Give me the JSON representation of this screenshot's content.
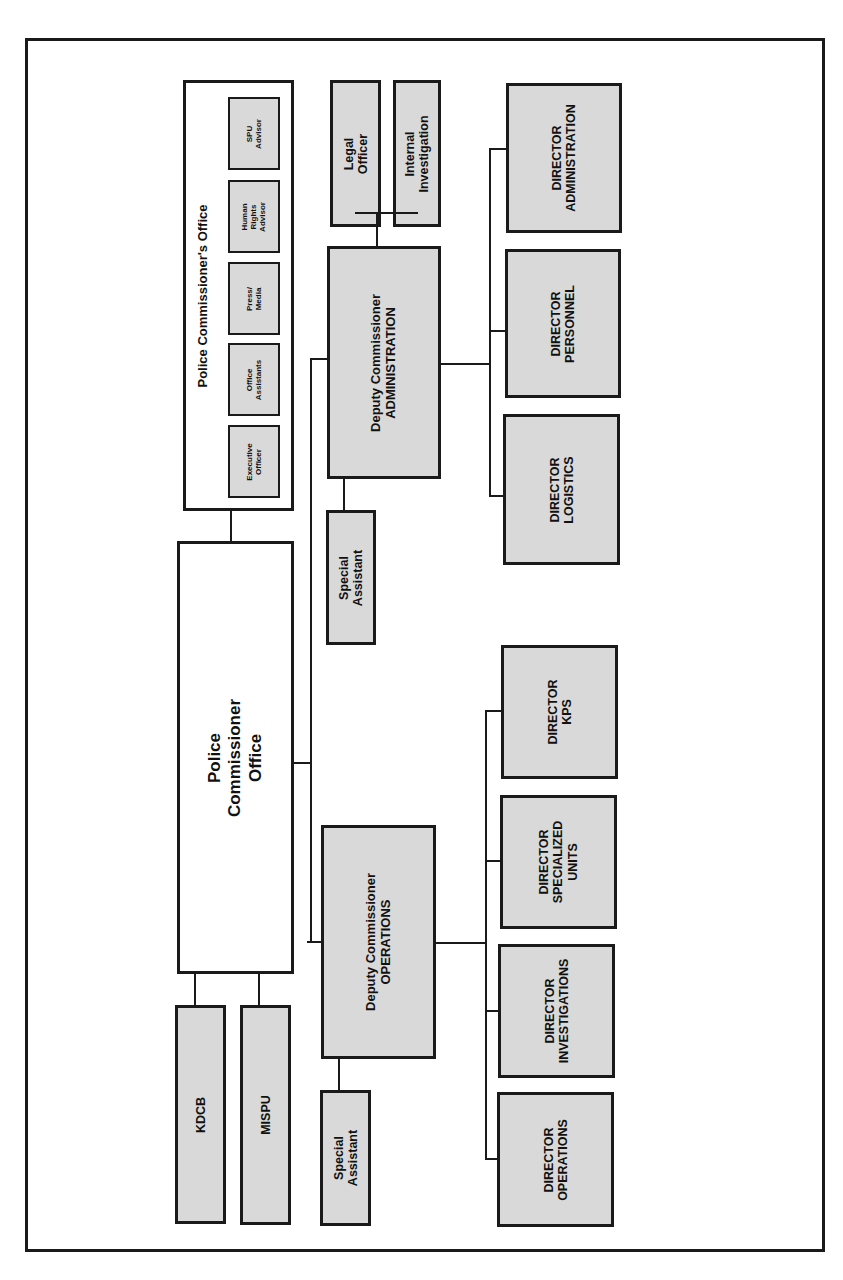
{
  "diagram": {
    "type": "organizational-chart",
    "orientation": "rotated-90-ccw",
    "colors": {
      "unit_fill": "#d9d9d9",
      "office_fill": "#ffffff",
      "border": "#1a1a1a"
    },
    "police_commissioner_office": {
      "line1": "Police",
      "line2": "Commissioner",
      "line3": "Office"
    },
    "commissioners_office_group": {
      "title": "Police Commissioner's Office",
      "members": [
        {
          "line1": "Executive",
          "line2": "Officer"
        },
        {
          "line1": "Office",
          "line2": "Assistants"
        },
        {
          "line1": "Press/",
          "line2": "Media"
        },
        {
          "line1": "Human",
          "line2": "Rights",
          "line3": "Advisor"
        },
        {
          "line1": "SPU",
          "line2": "Advisor"
        }
      ]
    },
    "direct_units": [
      {
        "label": "KDCB"
      },
      {
        "label": "MISPU"
      }
    ],
    "deputy_admin": {
      "line1": "Deputy Commissioner",
      "line2": "ADMINISTRATION",
      "advisors": [
        {
          "line1": "Legal",
          "line2": "Officer"
        },
        {
          "line1": "Internal",
          "line2": "Investigation"
        }
      ],
      "special_assistant": {
        "line1": "Special",
        "line2": "Assistant"
      },
      "directors": [
        {
          "line1": "DIRECTOR",
          "line2": "LOGISTICS"
        },
        {
          "line1": "DIRECTOR",
          "line2": "PERSONNEL"
        },
        {
          "line1": "DIRECTOR",
          "line2": "ADMINISTRATION"
        }
      ]
    },
    "deputy_ops": {
      "line1": "Deputy Commissioner",
      "line2": "OPERATIONS",
      "special_assistant": {
        "line1": "Special",
        "line2": "Assistant"
      },
      "directors": [
        {
          "line1": "DIRECTOR",
          "line2": "OPERATIONS"
        },
        {
          "line1": "DIRECTOR",
          "line2": "INVESTIGATIONS"
        },
        {
          "line1": "DIRECTOR",
          "line2": "SPECIALIZED",
          "line3": "UNITS"
        },
        {
          "line1": "DIRECTOR",
          "line2": "KPS"
        }
      ]
    }
  }
}
